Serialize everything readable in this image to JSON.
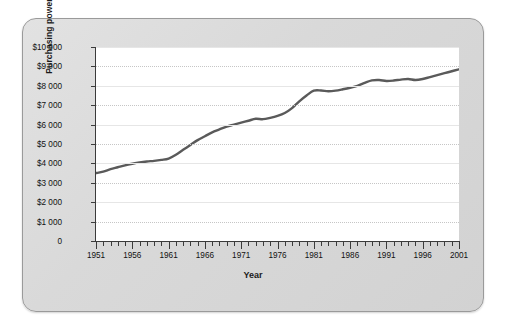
{
  "figure": {
    "background_color": "#d9d9d9",
    "plot_background_color": "#ffffff",
    "border_color": "#9a9a9a"
  },
  "chart_data": {
    "type": "line",
    "title": "",
    "xlabel": "Year",
    "ylabel": "Purchasing power",
    "xlim": [
      1951,
      2001
    ],
    "ylim": [
      0,
      10000
    ],
    "grid": true,
    "legend": null,
    "line_color": "#5a5a5a",
    "ytick_labels": [
      "0",
      "$1 000",
      "$2 000",
      "$3 000",
      "$4 000",
      "$5 000",
      "$6 000",
      "$7 000",
      "$8 000",
      "$9 000",
      "$10 000"
    ],
    "ytick_values": [
      0,
      1000,
      2000,
      3000,
      4000,
      5000,
      6000,
      7000,
      8000,
      9000,
      10000
    ],
    "xtick_labels": [
      "1951",
      "1956",
      "1961",
      "1966",
      "1971",
      "1976",
      "1981",
      "1986",
      "1991",
      "1996",
      "2001"
    ],
    "xtick_values": [
      1951,
      1956,
      1961,
      1966,
      1971,
      1976,
      1981,
      1986,
      1991,
      1996,
      2001
    ],
    "minor_xtick_interval": 1,
    "x": [
      1951,
      1952,
      1953,
      1954,
      1955,
      1956,
      1957,
      1958,
      1959,
      1960,
      1961,
      1962,
      1963,
      1964,
      1965,
      1966,
      1967,
      1968,
      1969,
      1970,
      1971,
      1972,
      1973,
      1974,
      1975,
      1976,
      1977,
      1978,
      1979,
      1980,
      1981,
      1982,
      1983,
      1984,
      1985,
      1986,
      1987,
      1988,
      1989,
      1990,
      1991,
      1992,
      1993,
      1994,
      1995,
      1996,
      1997,
      1998,
      1999,
      2000,
      2001
    ],
    "values": [
      3500,
      3580,
      3700,
      3800,
      3900,
      3980,
      4050,
      4100,
      4130,
      4180,
      4250,
      4450,
      4700,
      4950,
      5200,
      5400,
      5600,
      5750,
      5900,
      6000,
      6100,
      6200,
      6300,
      6280,
      6350,
      6450,
      6600,
      6850,
      7200,
      7500,
      7750,
      7760,
      7720,
      7750,
      7820,
      7900,
      8000,
      8150,
      8280,
      8300,
      8250,
      8270,
      8320,
      8350,
      8300,
      8350,
      8450,
      8550,
      8650,
      8750,
      8850
    ]
  }
}
